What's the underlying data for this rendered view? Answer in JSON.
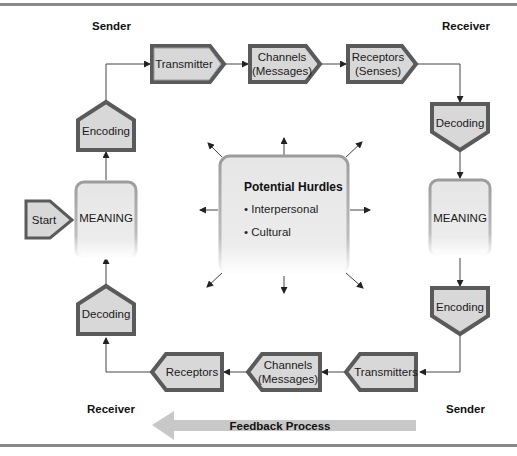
{
  "diagram": {
    "corner_labels": {
      "top_left": "Sender",
      "top_right": "Receiver",
      "bottom_left": "Receiver",
      "bottom_right": "Sender"
    },
    "top_flow": {
      "transmitter": "Transmitter",
      "channels_line1": "Channels",
      "channels_line2": "(Messages)",
      "receptors_line1": "Receptors",
      "receptors_line2": "(Senses)"
    },
    "right_flow": {
      "decoding": "Decoding",
      "meaning": "MEANING",
      "encoding": "Encoding"
    },
    "bottom_flow": {
      "transmitters": "Transmitters",
      "channels_line1": "Channels",
      "channels_line2": "(Messages)",
      "receptors": "Receptors"
    },
    "left_flow": {
      "decoding": "Decoding",
      "meaning": "MEANING",
      "encoding": "Encoding",
      "start": "Start"
    },
    "center": {
      "title": "Potential Hurdles",
      "items": [
        "• Interpersonal",
        "• Cultural"
      ]
    },
    "feedback": {
      "label": "Feedback Process"
    },
    "colors": {
      "box_fill": "#d8d8d8",
      "box_border_dark": "#5a5a5a",
      "box_border_light": "#9a9a9a",
      "rounded_fill": "#ececec",
      "rounded_border": "#a8a8a8",
      "feedback_arrow": "#c8c8c8",
      "rule": "#8a8a8a"
    }
  }
}
